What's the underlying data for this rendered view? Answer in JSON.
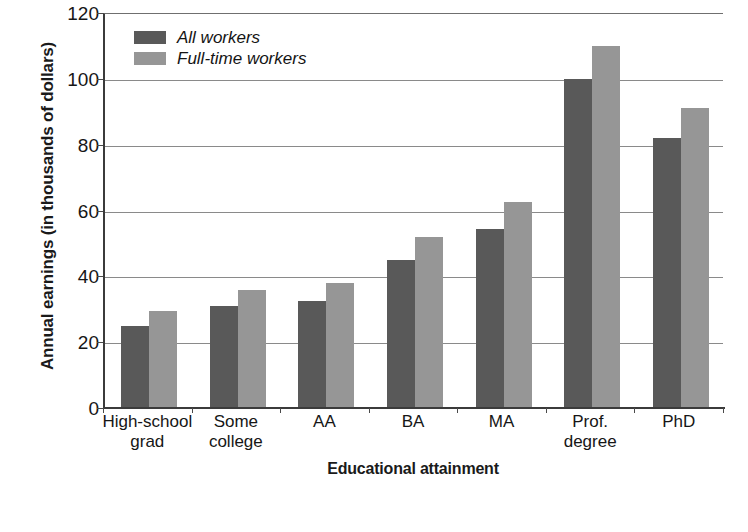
{
  "chart_data": {
    "type": "bar",
    "title": "",
    "xlabel": "Educational attainment",
    "ylabel": "Annual earnings (in thousands of dollars)",
    "categories": [
      "High-school grad",
      "Some college",
      "AA",
      "BA",
      "MA",
      "Prof. degree",
      "PhD"
    ],
    "category_lines": [
      [
        "High-school",
        "grad"
      ],
      [
        "Some",
        "college"
      ],
      [
        "AA"
      ],
      [
        "BA"
      ],
      [
        "MA"
      ],
      [
        "Prof.",
        "degree"
      ],
      [
        "PhD"
      ]
    ],
    "series": [
      {
        "name": "All workers",
        "color": "#595959",
        "values": [
          25,
          31,
          32.5,
          45,
          54.5,
          100,
          82
        ]
      },
      {
        "name": "Full-time workers",
        "color": "#969696",
        "values": [
          29.5,
          36,
          38,
          52,
          62.5,
          110,
          91
        ]
      }
    ],
    "ylim": [
      0,
      120
    ],
    "yticks": [
      0,
      20,
      40,
      60,
      80,
      100,
      120
    ],
    "ytick_labels": [
      "0",
      "20",
      "40",
      "60",
      "80",
      "100",
      "120"
    ],
    "grid": true,
    "legend_position": "top-left"
  },
  "legend": {
    "items": [
      {
        "label": "All workers",
        "color": "#595959"
      },
      {
        "label": "Full-time workers",
        "color": "#969696"
      }
    ]
  },
  "axes": {
    "y_title": "Annual earnings (in thousands of dollars)",
    "x_title": "Educational attainment"
  }
}
